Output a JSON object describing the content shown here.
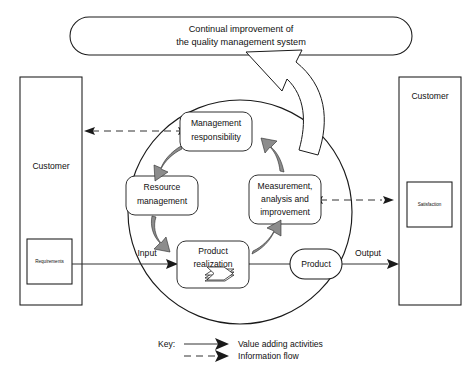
{
  "diagram": {
    "top_banner": {
      "line1": "Continual improvement of",
      "line2": "the quality management system"
    },
    "left_actor": {
      "label": "Customer",
      "sub_box_label": "Requirements"
    },
    "right_actor": {
      "label": "Customer",
      "sub_box_label": "Satisfaction"
    },
    "cycle_nodes": [
      {
        "id": "management-responsibility",
        "line1": "Management",
        "line2": "responsibility",
        "line3": ""
      },
      {
        "id": "resource-management",
        "line1": "Resource",
        "line2": "management",
        "line3": ""
      },
      {
        "id": "measurement-analysis-improvement",
        "line1": "Measurement,",
        "line2": "analysis and",
        "line3": "improvement"
      },
      {
        "id": "product-realization",
        "line1": "Product",
        "line2": "realization",
        "line3": ""
      }
    ],
    "product_node": {
      "label": "Product"
    },
    "flow_labels": {
      "input": "Input",
      "output": "Output"
    },
    "key": {
      "title": "Key:",
      "entries": [
        {
          "style": "solid",
          "label": "Value adding activities"
        },
        {
          "style": "dashed",
          "label": "Information flow"
        }
      ]
    },
    "colors": {
      "stroke": "#1a1a1a",
      "line": "#333333",
      "cycle_arrow_fill": "#8c8c8c",
      "background": "#ffffff"
    }
  }
}
